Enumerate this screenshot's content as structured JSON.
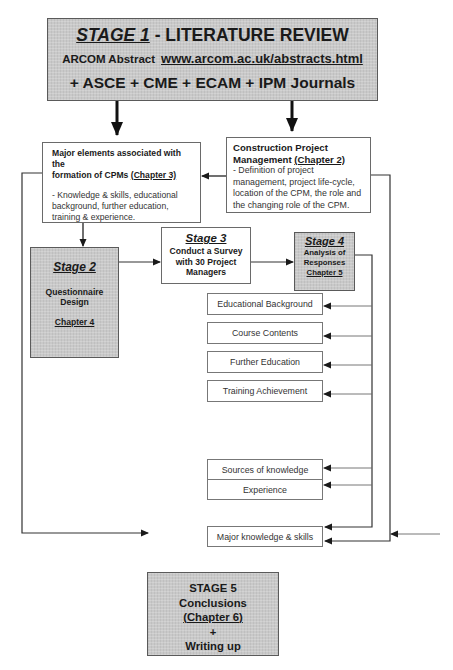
{
  "stage1": {
    "title_stage": "STAGE 1",
    "title_rest": " - LITERATURE REVIEW",
    "source_label": "ARCOM Abstract",
    "source_url": "www.arcom.ac.uk/abstracts.html",
    "journals": "+ ASCE + CME + ECAM + IPM Journals"
  },
  "major_elements": {
    "heading_line1": "Major elements associated with the",
    "heading_line2_text": "formation of CPMs ",
    "heading_chapter": "(Chapter 3)",
    "description": "-  Knowledge & skills, educational background, further education, training & experience."
  },
  "construction_pm": {
    "heading_line1": "Construction Project",
    "heading_line2_text": "Management ",
    "heading_chapter": "(Chapter 2)",
    "description": "-  Definition of project management, project life-cycle, location of the CPM, the role and the changing role of the CPM."
  },
  "stage2": {
    "stage": "Stage 2",
    "line1": "Questionnaire",
    "line2": "Design",
    "chapter": "Chapter 4"
  },
  "stage3": {
    "stage": "Stage 3",
    "line1": "Conduct a Survey",
    "line2": "with 30 Project",
    "line3": "Managers"
  },
  "stage4": {
    "stage": "Stage 4",
    "line1": "Analysis of",
    "line2": "Responses",
    "chapter": "Chapter 5"
  },
  "analysis_items": [
    "Educational Background",
    "Course Contents",
    "Further Education",
    "Training Achievement",
    "Sources of knowledge",
    "Experience",
    "Major knowledge & skills"
  ],
  "stage5": {
    "stage": "STAGE 5",
    "line1": "Conclusions",
    "chapter": "(Chapter 6)",
    "plus": "+",
    "line2": "Writing up"
  }
}
